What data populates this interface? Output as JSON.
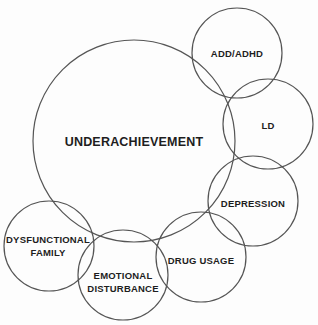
{
  "diagram": {
    "type": "overlapping-circles",
    "stroke_color": "#555555",
    "background": "#fdfdfd",
    "center_node": {
      "id": "underachievement",
      "label": "UNDERACHIEVEMENT",
      "cx": 134,
      "cy": 141,
      "r": 101
    },
    "nodes": [
      {
        "id": "add-adhd",
        "lines": [
          "ADD/ADHD"
        ],
        "cx": 237,
        "cy": 53,
        "r": 45
      },
      {
        "id": "ld",
        "lines": [
          "LD"
        ],
        "cx": 268,
        "cy": 124,
        "r": 45
      },
      {
        "id": "depression",
        "lines": [
          "DEPRESSION"
        ],
        "cx": 253,
        "cy": 201,
        "r": 45
      },
      {
        "id": "drug-usage",
        "lines": [
          "DRUG USAGE"
        ],
        "cx": 201,
        "cy": 257,
        "r": 45
      },
      {
        "id": "emotional-disturbance",
        "lines": [
          "EMOTIONAL",
          "DISTURBANCE"
        ],
        "cx": 123,
        "cy": 275,
        "r": 45
      },
      {
        "id": "dysfunctional-family",
        "lines": [
          "DYSFUNCTIONAL",
          "FAMILY"
        ],
        "cx": 49,
        "cy": 246,
        "r": 45
      }
    ]
  }
}
